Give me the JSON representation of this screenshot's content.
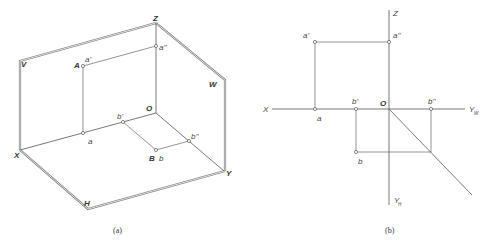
{
  "figure_a": {
    "caption": "(a)",
    "planes": {
      "V": "V",
      "H": "H",
      "W": "W"
    },
    "axes": {
      "X": "X",
      "Y": "Y",
      "Z": "Z",
      "O": "O"
    },
    "points": {
      "A": "A",
      "a_prime": "a'",
      "a_double_prime": "a''",
      "a": "a",
      "B": "B",
      "b_prime": "b'",
      "b_double_prime": "b''",
      "b": "b"
    }
  },
  "figure_b": {
    "caption": "(b)",
    "axes": {
      "X": "X",
      "Z": "Z",
      "O": "O",
      "Y_W": "Y",
      "Y_W_sub": "W",
      "Y_H": "Y",
      "Y_H_sub": "H"
    },
    "points": {
      "a_prime": "a'",
      "a_double_prime": "a''",
      "a": "a",
      "b_prime": "b'",
      "b_double_prime": "b''",
      "b": "b"
    }
  },
  "colors": {
    "line": "#666666",
    "plane_edge": "#777777",
    "text": "#444444",
    "background": "#ffffff"
  }
}
